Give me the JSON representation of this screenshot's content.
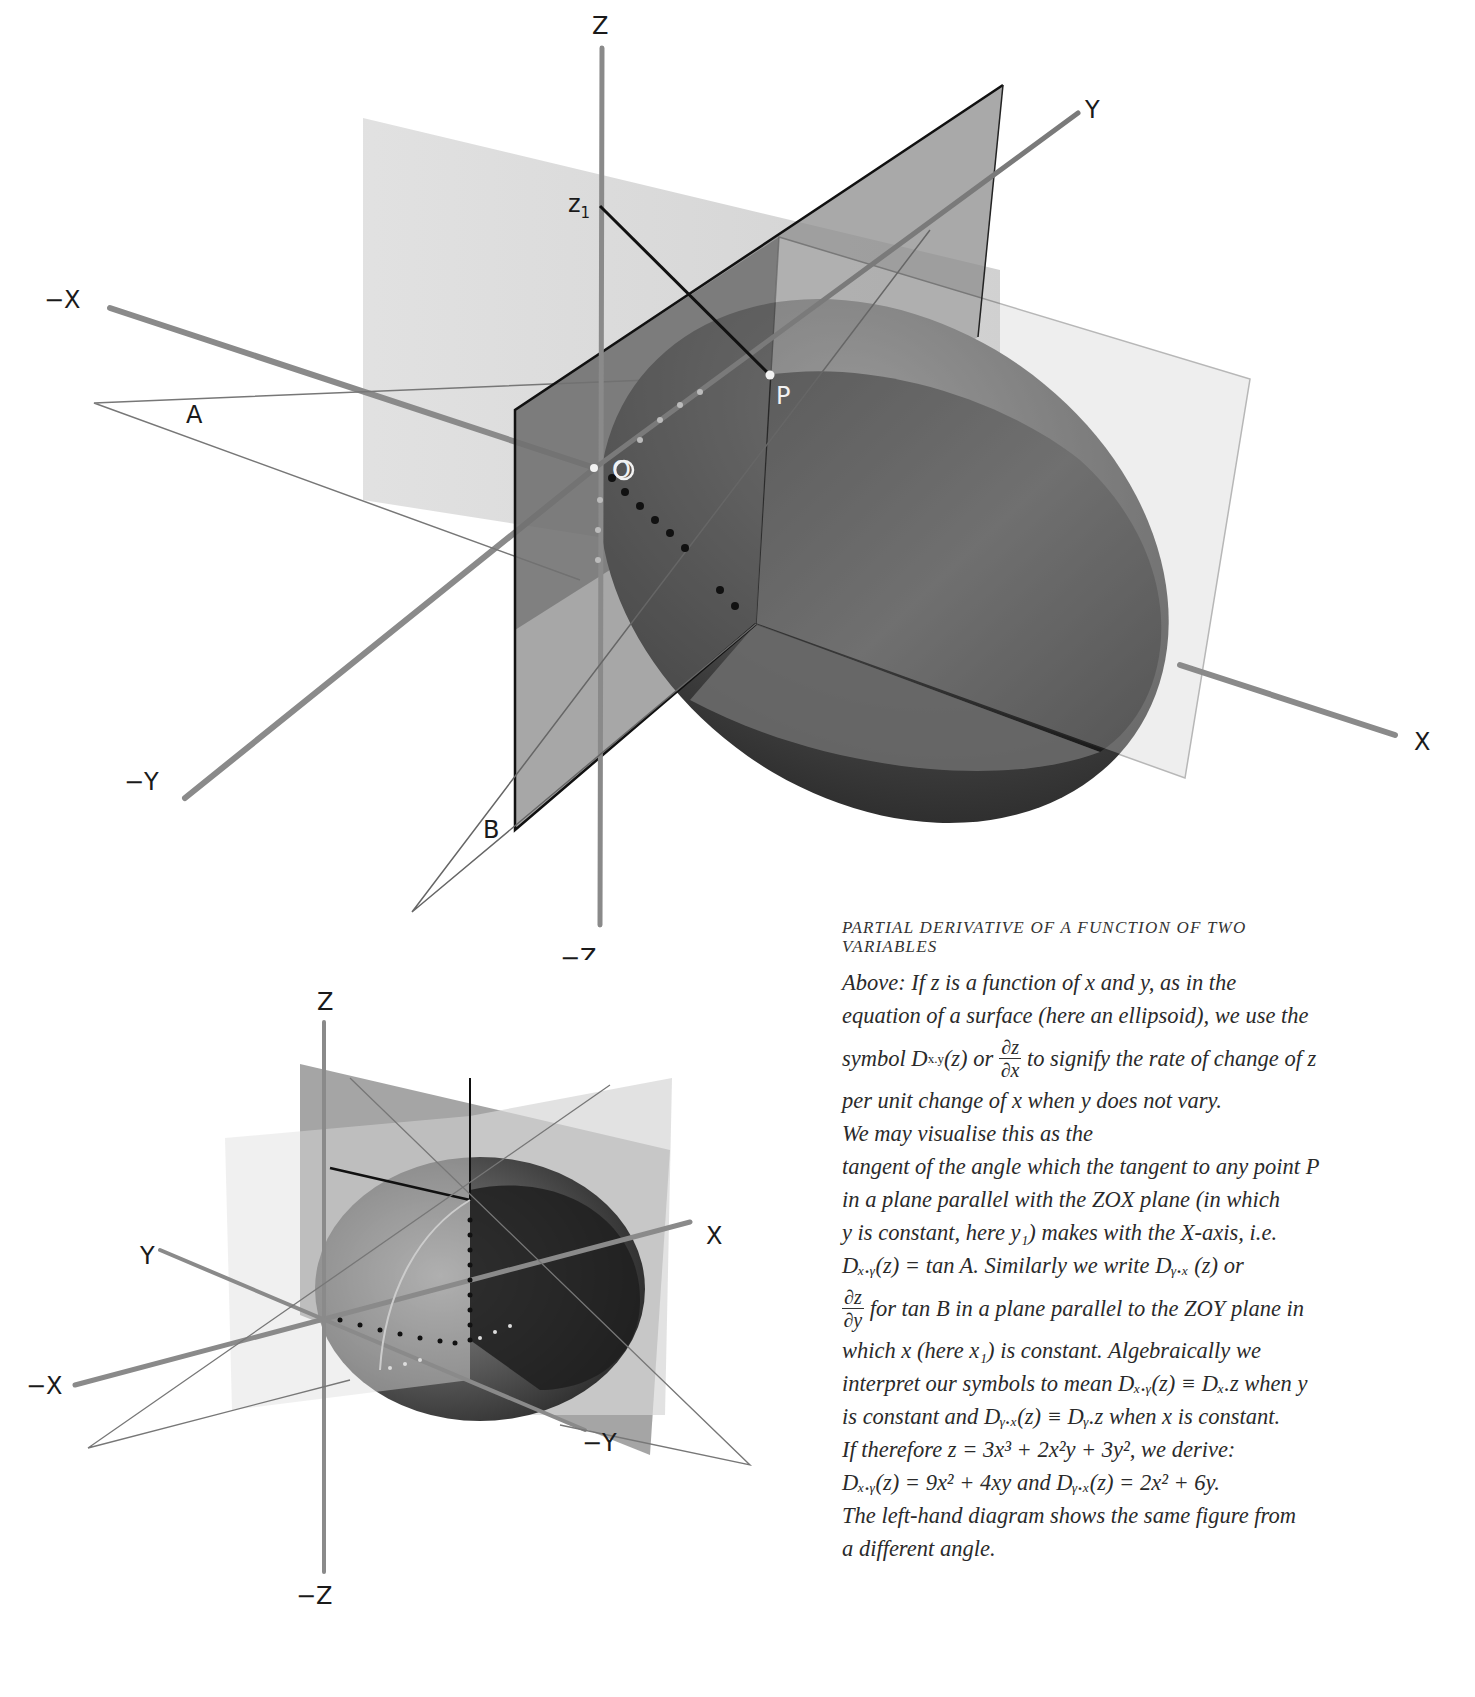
{
  "top_diagram": {
    "axis_labels": {
      "z": "Z",
      "neg_z": "−Z",
      "x": "X",
      "neg_x": "−X",
      "y": "Y",
      "neg_y": "−Y"
    },
    "point_labels": {
      "z1": "z",
      "z1_sub": "1",
      "p": "P",
      "o": "O",
      "a": "A",
      "b": "B"
    }
  },
  "bottom_diagram": {
    "axis_labels": {
      "z": "Z",
      "neg_z": "−Z",
      "x": "X",
      "neg_x": "−X",
      "y": "Y",
      "neg_y": "−Y"
    }
  },
  "caption": {
    "heading_line1": "PARTIAL DERIVATIVE OF A FUNCTION OF TWO",
    "heading_line2": "VARIABLES",
    "lines": [
      "Above: If z is a function of x and y, as in the",
      "equation of a surface (here an ellipsoid), we use the",
      "per unit change of x when y does not vary.",
      "We may visualise this as the",
      "tangent of the angle which the tangent to any point P",
      "in a plane parallel with the ZOX plane (in which",
      "which x (here x₁) is constant.  Algebraically we",
      "interpret our symbols to mean Dₓ.ᵧ(z) ≡ Dₓ.z when y",
      "is constant and Dᵧ.ₓ(z) ≡ Dᵧ.z when x is constant.",
      "If therefore z = 3x³ + 2x²y + 3y², we derive:",
      "Dₓ.ᵧ(z) = 9x² + 4xy and Dᵧ.ₓ(z) = 2x² + 6y.",
      "The left-hand diagram shows the same figure from",
      "a different angle."
    ],
    "symbol_line_before": "symbol D",
    "symbol_line_sub": "x.y",
    "symbol_line_mid": "(z) or",
    "symbol_frac_num": "∂z",
    "symbol_frac_den": "∂x",
    "symbol_line_after": "to signify the rate of change of z",
    "yconst_line": "y is constant, here y₁) makes with the X-axis, i.e.",
    "tanA_line": "Dₓ.ᵧ(z) = tan A.  Similarly we write Dᵧ.ₓ (z) or",
    "tanB_frac_num": "∂z",
    "tanB_frac_den": "∂y",
    "tanB_line_after": "for tan B in a plane parallel to the ZOY plane in"
  },
  "colors": {
    "paper": "#ffffff",
    "ink": "#1a1a1a",
    "axis_gray": "#8a8a8a",
    "plane_light": "#d9d9d9",
    "plane_mid": "#a8a8a8",
    "plane_dark": "#707070",
    "ellipsoid_dark": "#2e2e2e",
    "ellipsoid_mid": "#5a5a5a"
  }
}
